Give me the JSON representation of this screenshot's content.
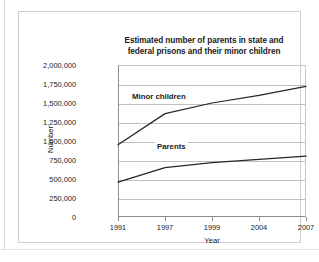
{
  "figure": {
    "title_line1": "Estimated number of parents in state and",
    "title_line2": "federal prisons and their minor children"
  },
  "chart_data": {
    "type": "line",
    "title": "Estimated number of parents in state and federal prisons and their minor children",
    "xlabel": "Year",
    "ylabel": "Number",
    "categories": [
      "1991",
      "1997",
      "1999",
      "2004",
      "2007"
    ],
    "ylim": [
      0,
      2000000
    ],
    "ytick_labels": [
      "2,000,000",
      "1,750,000",
      "1,500,000",
      "1,250,000",
      "1,000,000",
      "750,000",
      "500,000",
      "250,000",
      "0"
    ],
    "ytick_values": [
      2000000,
      1750000,
      1500000,
      1250000,
      1000000,
      750000,
      500000,
      250000,
      0
    ],
    "grid": true,
    "legend": "inline-labels",
    "series": [
      {
        "name": "Minor children",
        "values": [
          950000,
          1360000,
          1500000,
          1600000,
          1720000
        ]
      },
      {
        "name": "Parents",
        "values": [
          460000,
          650000,
          715000,
          757000,
          800000
        ]
      }
    ]
  }
}
